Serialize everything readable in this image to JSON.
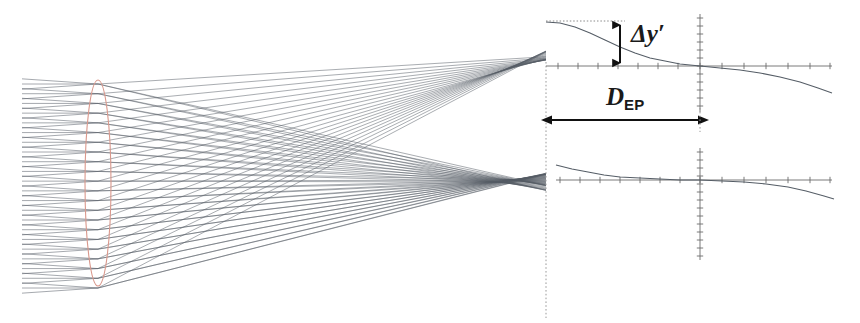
{
  "figure": {
    "name": "optical-ray-trace-spot-diagram",
    "width": 860,
    "height": 323,
    "background_color": "#ffffff"
  },
  "labels": {
    "delta_y_prime": "Δy",
    "delta_y_prime_prime_mark": "′",
    "d_ep_base": "D",
    "d_ep_subscript": "EP"
  },
  "colors": {
    "ray_color": "#3d4550",
    "lens_color": "#d9988c",
    "axis_color": "#6b6b6b",
    "dotted_color": "#8a8a8a",
    "annotation_color": "#1a1a1a"
  },
  "optics": {
    "lens": {
      "center_x": 98,
      "center_y": 183,
      "semi_width": 13,
      "semi_height": 103
    },
    "ray_bundle": {
      "start_x": 22,
      "end_x": 546,
      "ray_count": 22,
      "fan_count": 3,
      "entrance_top_y": 84,
      "entrance_bottom_y": 288
    },
    "foci": [
      {
        "name": "upper-focus",
        "x": 520,
        "y": 66
      },
      {
        "name": "lower-focus",
        "x": 516,
        "y": 180
      }
    ],
    "entrance_pupil_plane_x": 546,
    "image_plane_x": 700
  },
  "chart_data": {
    "type": "line",
    "title": "",
    "xlabel": "",
    "ylabel": "",
    "legend": [],
    "grid": false,
    "plots": [
      {
        "name": "upper-transverse-ray-aberration",
        "axis_origin": {
          "x": 700,
          "y": 66
        },
        "x_axis_range": [
          546,
          832
        ],
        "y_axis_range": [
          14,
          112
        ],
        "x_ticks": [
          558,
          578,
          598,
          618,
          638,
          658,
          678,
          700,
          722,
          744,
          766,
          788,
          810,
          830
        ],
        "y_ticks": [
          18,
          26,
          34,
          42,
          50,
          58,
          66,
          74,
          82,
          90,
          98,
          106
        ],
        "curve_points": [
          [
            546,
            22
          ],
          [
            560,
            23
          ],
          [
            575,
            27
          ],
          [
            590,
            33
          ],
          [
            605,
            40
          ],
          [
            620,
            47
          ],
          [
            635,
            53
          ],
          [
            650,
            58
          ],
          [
            665,
            61
          ],
          [
            680,
            64
          ],
          [
            700,
            66
          ],
          [
            720,
            68
          ],
          [
            740,
            70
          ],
          [
            760,
            73
          ],
          [
            780,
            77
          ],
          [
            800,
            82
          ],
          [
            818,
            88
          ],
          [
            832,
            93
          ]
        ],
        "annotation": {
          "name": "delta-y-prime-measure",
          "label": "Δy′",
          "arrow_x": 620,
          "arrow_top_y": 22,
          "arrow_bottom_y": 66,
          "value_span_px": 44,
          "dotted_reference_line": {
            "from_x": 546,
            "to_x": 625,
            "y": 21
          }
        }
      },
      {
        "name": "lower-transverse-ray-aberration",
        "axis_origin": {
          "x": 700,
          "y": 180
        },
        "x_axis_range": [
          556,
          832
        ],
        "y_axis_range": [
          148,
          260
        ],
        "x_ticks": [
          560,
          580,
          600,
          620,
          640,
          660,
          680,
          700,
          722,
          744,
          766,
          788,
          810,
          830
        ],
        "y_ticks": [
          152,
          160,
          168,
          176,
          184,
          192,
          200,
          208,
          216,
          224,
          232,
          240,
          248,
          256
        ],
        "curve_points": [
          [
            556,
            165
          ],
          [
            572,
            169
          ],
          [
            588,
            172
          ],
          [
            604,
            175
          ],
          [
            620,
            177
          ],
          [
            640,
            178
          ],
          [
            660,
            179
          ],
          [
            680,
            180
          ],
          [
            700,
            180
          ],
          [
            722,
            181
          ],
          [
            744,
            182
          ],
          [
            766,
            184
          ],
          [
            788,
            187
          ],
          [
            806,
            191
          ],
          [
            824,
            196
          ],
          [
            834,
            199
          ]
        ]
      }
    ],
    "measurement_annotation": {
      "name": "d-ep-dimension",
      "label": "D_EP",
      "label_text": "DEP",
      "arrow_from_x": 552,
      "arrow_to_x": 698,
      "arrow_y": 120,
      "span_px": 146,
      "double_headed": true
    },
    "reference_lines": [
      {
        "name": "entrance-pupil-plane",
        "orientation": "vertical",
        "x": 546,
        "from_y": 62,
        "to_y": 318,
        "style": "dotted"
      }
    ]
  }
}
